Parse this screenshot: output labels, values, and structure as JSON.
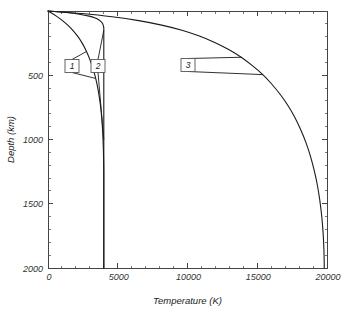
{
  "chart_data": {
    "type": "line",
    "title": "",
    "xlabel": "Temperature (K)",
    "ylabel": "Depth (km)",
    "xlim": [
      0,
      20000
    ],
    "ylim": [
      0,
      2000
    ],
    "y_inverted": true,
    "grid": false,
    "legend": "none",
    "x_ticks": [
      {
        "value": 0,
        "label": "0"
      },
      {
        "value": 5000,
        "label": "5000"
      },
      {
        "value": 10000,
        "label": "10000"
      },
      {
        "value": 15000,
        "label": "15000"
      },
      {
        "value": 20000,
        "label": "20000"
      }
    ],
    "x_minor_step": 1000,
    "y_ticks": [
      {
        "value": 500,
        "label": "500"
      },
      {
        "value": 1000,
        "label": "1000"
      },
      {
        "value": 1500,
        "label": "1500"
      },
      {
        "value": 2000,
        "label": "2000"
      }
    ],
    "y_minor_step": 100,
    "series": [
      {
        "name": "1",
        "annotation_label": "1",
        "points": [
          [
            0,
            0
          ],
          [
            600,
            40
          ],
          [
            1150,
            85
          ],
          [
            1650,
            135
          ],
          [
            2080,
            190
          ],
          [
            2450,
            250
          ],
          [
            2760,
            315
          ],
          [
            3010,
            380
          ],
          [
            3230,
            450
          ],
          [
            3420,
            525
          ],
          [
            3570,
            600
          ],
          [
            3690,
            680
          ],
          [
            3790,
            760
          ],
          [
            3860,
            845
          ],
          [
            3915,
            930
          ],
          [
            3950,
            1015
          ],
          [
            3975,
            1100
          ],
          [
            3990,
            1180
          ],
          [
            4000,
            1260
          ],
          [
            4000,
            1500
          ],
          [
            4000,
            2000
          ]
        ]
      },
      {
        "name": "2",
        "annotation_label": "2",
        "points": [
          [
            0,
            0
          ],
          [
            1300,
            12
          ],
          [
            2250,
            25
          ],
          [
            2950,
            40
          ],
          [
            3380,
            55
          ],
          [
            3650,
            70
          ],
          [
            3820,
            85
          ],
          [
            3920,
            100
          ],
          [
            3970,
            115
          ],
          [
            3995,
            130
          ],
          [
            4000,
            150
          ],
          [
            4000,
            400
          ],
          [
            4000,
            1000
          ],
          [
            4000,
            1500
          ],
          [
            4000,
            2000
          ]
        ]
      },
      {
        "name": "3",
        "annotation_label": "3",
        "points": [
          [
            0,
            0
          ],
          [
            2400,
            20
          ],
          [
            4600,
            45
          ],
          [
            6500,
            75
          ],
          [
            8150,
            110
          ],
          [
            9600,
            150
          ],
          [
            10850,
            195
          ],
          [
            11950,
            245
          ],
          [
            12950,
            300
          ],
          [
            13850,
            360
          ],
          [
            14650,
            425
          ],
          [
            15400,
            495
          ],
          [
            16050,
            570
          ],
          [
            16650,
            650
          ],
          [
            17200,
            735
          ],
          [
            17680,
            825
          ],
          [
            18100,
            920
          ],
          [
            18480,
            1020
          ],
          [
            18800,
            1125
          ],
          [
            19070,
            1235
          ],
          [
            19300,
            1350
          ],
          [
            19480,
            1470
          ],
          [
            19620,
            1595
          ],
          [
            19720,
            1725
          ],
          [
            19780,
            1860
          ],
          [
            19800,
            1960
          ],
          [
            19800,
            2000
          ]
        ]
      }
    ],
    "annotations": [
      {
        "label": "1",
        "x_px": 72,
        "y_px": 66
      },
      {
        "label": "2",
        "x_px": 98,
        "y_px": 66
      },
      {
        "label": "3",
        "x_px": 188,
        "y_px": 65
      }
    ],
    "colors": {
      "curve": "#1a1a1a",
      "axis": "#444444",
      "text": "#222222",
      "background": "#ffffff"
    }
  }
}
